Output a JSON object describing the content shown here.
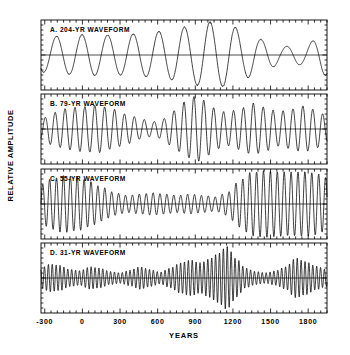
{
  "figure": {
    "ylabel": "RELATIVE AMPLITUDE",
    "xlabel": "YEARS",
    "background": "#ffffff",
    "line_color": "#000000"
  },
  "chart_data": {
    "type": "line",
    "title": "",
    "xlabel": "YEARS",
    "ylabel": "RELATIVE AMPLITUDE",
    "xlim": [
      -330,
      1950
    ],
    "xticks": [
      -300,
      0,
      300,
      600,
      900,
      1200,
      1500,
      1800
    ],
    "xtick_labels": [
      "-300",
      "0",
      "300",
      "600",
      "900",
      "1200",
      "1500",
      "1800"
    ],
    "minor_tick_interval": 50,
    "grid": false,
    "legend": "none",
    "shared_x_axis": true,
    "baseline_value": 0,
    "panels": [
      {
        "id": "A",
        "label": "A. 204-YR  WAVEFORM",
        "period_years": 204,
        "ylim": [
          -1.15,
          1.15
        ],
        "envelope_x": [
          -330,
          -150,
          50,
          250,
          450,
          650,
          850,
          1000,
          1150,
          1300,
          1450,
          1600,
          1750,
          1950
        ],
        "envelope_y": [
          0.52,
          0.58,
          0.62,
          0.6,
          0.64,
          0.72,
          0.86,
          1.0,
          0.95,
          0.7,
          0.45,
          0.26,
          0.3,
          0.62
        ],
        "phase_deg": 95
      },
      {
        "id": "B",
        "label": "B. 79-YR  WAVEFORM",
        "period_years": 79,
        "ylim": [
          -1.15,
          1.15
        ],
        "envelope_x": [
          -330,
          -230,
          -120,
          0,
          120,
          240,
          360,
          470,
          560,
          640,
          720,
          820,
          900,
          980,
          1060,
          1150,
          1260,
          1360,
          1460,
          1560,
          1660,
          1760,
          1860,
          1950
        ],
        "envelope_y": [
          0.3,
          0.5,
          0.62,
          0.68,
          0.72,
          0.6,
          0.44,
          0.3,
          0.22,
          0.3,
          0.55,
          0.82,
          1.0,
          0.86,
          0.62,
          0.5,
          0.62,
          0.78,
          0.66,
          0.52,
          0.6,
          0.7,
          0.58,
          0.4
        ],
        "phase_deg": 0
      },
      {
        "id": "C",
        "label": "C. 55-YR  WAVEFORM",
        "period_years": 55,
        "ylim": [
          -1.15,
          1.15
        ],
        "envelope_x": [
          -330,
          -250,
          -150,
          -50,
          50,
          150,
          260,
          360,
          460,
          560,
          660,
          760,
          860,
          960,
          1060,
          1150,
          1250,
          1350,
          1450,
          1550,
          1650,
          1750,
          1850,
          1950
        ],
        "envelope_y": [
          0.58,
          0.76,
          0.86,
          0.82,
          0.7,
          0.52,
          0.34,
          0.26,
          0.3,
          0.34,
          0.3,
          0.26,
          0.3,
          0.26,
          0.22,
          0.34,
          0.7,
          0.96,
          1.0,
          0.98,
          0.96,
          0.98,
          0.94,
          0.8
        ],
        "phase_deg": 0
      },
      {
        "id": "D",
        "label": "D. 31-YR  WAVEFORM",
        "period_years": 31,
        "ylim": [
          -1.15,
          1.15
        ],
        "envelope_x": [
          -330,
          -260,
          -180,
          -100,
          -20,
          60,
          140,
          220,
          300,
          380,
          460,
          540,
          620,
          700,
          780,
          860,
          940,
          1010,
          1080,
          1150,
          1230,
          1300,
          1380,
          1460,
          1540,
          1620,
          1700,
          1780,
          1860,
          1950
        ],
        "envelope_y": [
          0.3,
          0.42,
          0.38,
          0.26,
          0.22,
          0.34,
          0.3,
          0.2,
          0.16,
          0.24,
          0.34,
          0.26,
          0.18,
          0.3,
          0.46,
          0.54,
          0.46,
          0.58,
          0.74,
          0.96,
          0.58,
          0.3,
          0.2,
          0.16,
          0.22,
          0.34,
          0.6,
          0.5,
          0.36,
          0.26
        ],
        "phase_deg": 0
      }
    ]
  },
  "axes_geometry": {
    "plot_left": 41,
    "plot_right": 327,
    "panel_tops": [
      20,
      94,
      169,
      243
    ],
    "panel_height": 70,
    "panel_gap": 4
  }
}
